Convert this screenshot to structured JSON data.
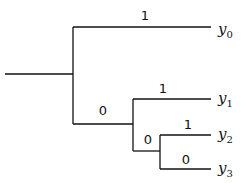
{
  "diagram": {
    "type": "binary-code-tree",
    "edge_labels": [
      {
        "id": "e-root-y0",
        "text": "1",
        "x": 145,
        "y": 15
      },
      {
        "id": "e-n1-y1",
        "text": "1",
        "x": 163,
        "y": 88
      },
      {
        "id": "e-root-n1",
        "text": "0",
        "x": 103,
        "y": 110
      },
      {
        "id": "e-n2-y2",
        "text": "1",
        "x": 188,
        "y": 124
      },
      {
        "id": "e-n1-n2",
        "text": "0",
        "x": 148,
        "y": 139
      },
      {
        "id": "e-n2-y3",
        "text": "0",
        "x": 186,
        "y": 159
      }
    ],
    "leaves": [
      {
        "id": "y0",
        "base": "y",
        "sub": "0",
        "x": 218,
        "y": 31
      },
      {
        "id": "y1",
        "base": "y",
        "sub": "1",
        "x": 218,
        "y": 100
      },
      {
        "id": "y2",
        "base": "y",
        "sub": "2",
        "x": 218,
        "y": 136
      },
      {
        "id": "y3",
        "base": "y",
        "sub": "3",
        "x": 218,
        "y": 170
      }
    ],
    "line_color": "#111111"
  }
}
